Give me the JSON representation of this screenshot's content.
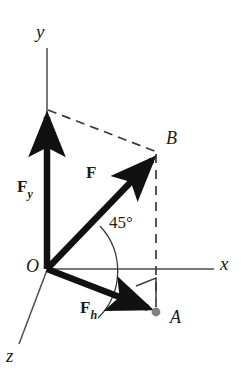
{
  "figure": {
    "type": "vector-decomposition-diagram",
    "background_color": "#ffffff",
    "stroke_color": "#1a1a1a",
    "axis_color": "#4d4d4d",
    "dot_color": "#808080",
    "dash_color": "#3a3a3a"
  },
  "axes": [
    {
      "name": "y",
      "label": "y",
      "label_x": 36,
      "label_y": 22,
      "from": [
        47,
        48
      ],
      "to": [
        47,
        270
      ]
    },
    {
      "name": "x",
      "label": "x",
      "label_x": 220,
      "label_y": 254,
      "from": [
        47,
        269
      ],
      "to": [
        214,
        269
      ]
    },
    {
      "name": "z",
      "label": "z",
      "label_x": 6,
      "label_y": 346,
      "from": [
        47,
        270
      ],
      "to": [
        19,
        344
      ]
    }
  ],
  "points": [
    {
      "name": "O",
      "label": "O",
      "label_x": 26,
      "label_y": 257,
      "x": 47,
      "y": 269,
      "marker": "none"
    },
    {
      "name": "B",
      "label": "B",
      "label_x": 166,
      "label_y": 129,
      "x": 157,
      "y": 154,
      "marker": "none"
    },
    {
      "name": "A",
      "label": "A",
      "label_x": 170,
      "label_y": 308,
      "x": 156,
      "y": 312,
      "marker": "dot"
    }
  ],
  "vectors": [
    {
      "name": "F",
      "label": "F",
      "subscript": "",
      "label_x": 86,
      "label_y": 164,
      "from": [
        47,
        269
      ],
      "to": [
        157,
        155
      ],
      "style": "solid-thick-arrow"
    },
    {
      "name": "F_y",
      "label": "F",
      "subscript": "y",
      "label_x": 17,
      "label_y": 178,
      "from": [
        47,
        269
      ],
      "to": [
        47,
        111
      ],
      "style": "solid-thick-arrow"
    },
    {
      "name": "F_h",
      "label": "F",
      "subscript": "h",
      "label_x": 80,
      "label_y": 299,
      "from": [
        47,
        269
      ],
      "to": [
        155,
        311
      ],
      "style": "solid-thick-arrow"
    }
  ],
  "construction_lines": [
    {
      "name": "dash-ytip-to-B",
      "from": [
        48,
        110
      ],
      "to": [
        157,
        152
      ],
      "style": "dashed"
    },
    {
      "name": "dash-B-to-A",
      "from": [
        156,
        154
      ],
      "to": [
        156,
        311
      ],
      "style": "dashed"
    }
  ],
  "annotations": {
    "angle": {
      "name": "angle-45",
      "label": "45°",
      "label_x": 109,
      "label_y": 214,
      "value": 45,
      "unit": "degrees",
      "between": [
        "F",
        "F_h"
      ],
      "arc_radius": 66
    },
    "right_angle": {
      "name": "right-angle-marker",
      "at": [
        156,
        295
      ],
      "label": "",
      "between": [
        "F_h",
        "dash-B-to-A"
      ]
    }
  }
}
